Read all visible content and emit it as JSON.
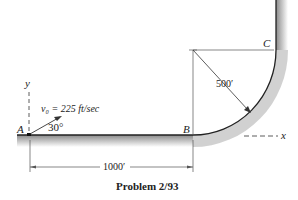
{
  "figure": {
    "caption": "Problem 2/93",
    "points": {
      "A": "A",
      "B": "B",
      "C": "C"
    },
    "axes": {
      "x": "x",
      "y": "y"
    },
    "velocity_label": "v₀ = 225 ft/sec",
    "angle_label": "30°",
    "radius_label": "500′",
    "distance_label": "1000′",
    "colors": {
      "line": "#222222",
      "ground": "#9a9a9a"
    }
  }
}
